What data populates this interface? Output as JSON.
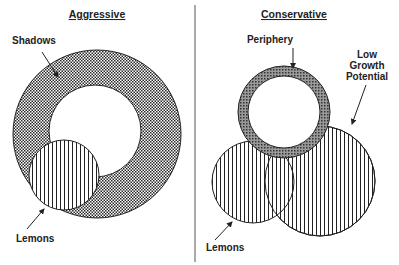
{
  "panels": {
    "aggressive": {
      "title": "Aggressive",
      "labels": {
        "shadows": "Shadows",
        "lemons": "Lemons"
      }
    },
    "conservative": {
      "title": "Conservative",
      "labels": {
        "periphery": "Periphery",
        "low_growth_line1": "Low",
        "low_growth_line2": "Growth",
        "low_growth_line3": "Potential",
        "lemons": "Lemons"
      }
    }
  },
  "colors": {
    "stroke": "#222222",
    "crosshatch": "#333333",
    "background": "#ffffff"
  }
}
